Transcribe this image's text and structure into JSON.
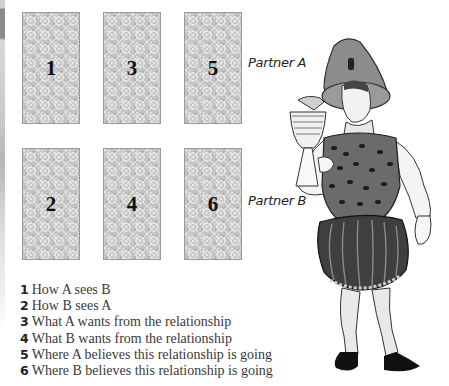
{
  "spread": {
    "cards": [
      {
        "position": "1",
        "row": "Partner A",
        "column": 1
      },
      {
        "position": "3",
        "row": "Partner A",
        "column": 2
      },
      {
        "position": "5",
        "row": "Partner A",
        "column": 3
      },
      {
        "position": "2",
        "row": "Partner B",
        "column": 1
      },
      {
        "position": "4",
        "row": "Partner B",
        "column": 2
      },
      {
        "position": "6",
        "row": "Partner B",
        "column": 3
      }
    ],
    "row_labels": [
      "Partner A",
      "Partner B"
    ]
  },
  "legend": [
    {
      "num": "1",
      "text": "How A sees B"
    },
    {
      "num": "2",
      "text": "How B sees A"
    },
    {
      "num": "3",
      "text": "What A wants from the relationship"
    },
    {
      "num": "4",
      "text": "What B wants from the relationship"
    },
    {
      "num": "5",
      "text": "Where A believes this relationship is going"
    },
    {
      "num": "6",
      "text": "Where B believes this relationship is going"
    }
  ],
  "illustration": {
    "subject": "tarot-knight-of-cups-style figure holding a goblet",
    "icon": "figure-illustration"
  },
  "colors": {
    "card_fill": "#c4c4c4",
    "card_border": "#9a9a9a",
    "text": "#333333"
  }
}
